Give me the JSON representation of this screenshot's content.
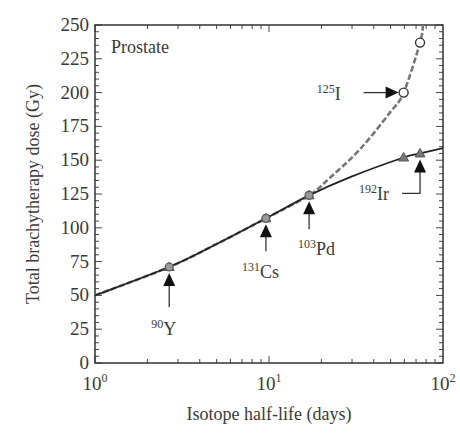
{
  "chart_data": {
    "type": "line",
    "title": "",
    "panel_label": "Prostate",
    "xlabel": "Isotope half-life (days)",
    "ylabel": "Total brachytherapy dose (Gy)",
    "xscale": "log",
    "xlim": [
      1,
      100
    ],
    "ylim": [
      0,
      250
    ],
    "x_ticks": [
      {
        "value": 1,
        "base": "10",
        "exp": "0"
      },
      {
        "value": 10,
        "base": "10",
        "exp": "1"
      },
      {
        "value": 100,
        "base": "10",
        "exp": "2"
      }
    ],
    "y_ticks": [
      0,
      25,
      50,
      75,
      100,
      125,
      150,
      175,
      200,
      225,
      250
    ],
    "grid": false,
    "legend": null,
    "series": [
      {
        "name": "solid",
        "style": "solid",
        "color": "#222222",
        "x": [
          1,
          2.67,
          5,
          9.6,
          17,
          30,
          59.4,
          73.8,
          100
        ],
        "y": [
          50,
          71,
          88,
          107,
          124,
          138,
          152,
          155,
          159
        ],
        "markers": [
          {
            "x": 2.67,
            "y": 71,
            "shape": "triangle"
          },
          {
            "x": 9.6,
            "y": 107,
            "shape": "triangle"
          },
          {
            "x": 17,
            "y": 124,
            "shape": "triangle"
          },
          {
            "x": 59.4,
            "y": 152,
            "shape": "triangle"
          },
          {
            "x": 73.8,
            "y": 155,
            "shape": "triangle"
          }
        ]
      },
      {
        "name": "dashed",
        "style": "dashed",
        "color": "#777777",
        "x": [
          1,
          2.67,
          5,
          9.6,
          17,
          22.4,
          33.3,
          49.4,
          59.4,
          73.8,
          76.7
        ],
        "y": [
          50,
          71,
          88,
          107,
          124,
          137,
          158,
          185,
          200,
          237,
          250
        ],
        "markers": [
          {
            "x": 2.67,
            "y": 71,
            "shape": "circle"
          },
          {
            "x": 9.6,
            "y": 107,
            "shape": "circle"
          },
          {
            "x": 17,
            "y": 124,
            "shape": "circle"
          },
          {
            "x": 59.4,
            "y": 200,
            "shape": "open-circle"
          },
          {
            "x": 73.8,
            "y": 237,
            "shape": "open-circle"
          }
        ]
      }
    ],
    "annotations": [
      {
        "mass": "90",
        "symbol": "Y",
        "half_life_days": 2.67,
        "dose_gy": 71,
        "arrow": "up"
      },
      {
        "mass": "131",
        "symbol": "Cs",
        "half_life_days": 9.6,
        "dose_gy": 107,
        "arrow": "up"
      },
      {
        "mass": "103",
        "symbol": "Pd",
        "half_life_days": 17,
        "dose_gy": 124,
        "arrow": "up"
      },
      {
        "mass": "125",
        "symbol": "I",
        "half_life_days": 59.4,
        "dose_gy": 200,
        "arrow": "right"
      },
      {
        "mass": "192",
        "symbol": "Ir",
        "half_life_days": 73.8,
        "dose_gy": 155,
        "arrow": "up-elbow"
      }
    ]
  }
}
